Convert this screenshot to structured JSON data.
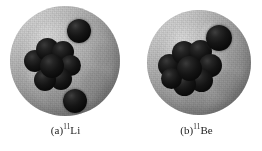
{
  "figure": {
    "kind": "scientific-illustration",
    "background_color": "#ffffff",
    "halo_color": "#9d9d9d",
    "nucleon_color": "#101010"
  },
  "panels": [
    {
      "id": "panel-a",
      "label_prefix": "(a)",
      "mass_number": "11",
      "element_symbol": "Li",
      "caption_full": "(a)11Li",
      "halo": {
        "name": "halo-sphere",
        "center_x": 65,
        "center_y": 61,
        "radius": 55
      },
      "core": {
        "name": "core-cluster",
        "center_x": 52,
        "center_y": 64,
        "nucleon_count": 7
      },
      "halo_neutrons": [
        {
          "name": "halo-neutron-upper-right",
          "center_x": 79,
          "center_y": 31,
          "radius": 12
        },
        {
          "name": "halo-neutron-lower-right",
          "center_x": 75,
          "center_y": 101,
          "radius": 12
        }
      ]
    },
    {
      "id": "panel-b",
      "label_prefix": "(b)",
      "mass_number": "11",
      "element_symbol": "Be",
      "caption_full": "(b)11Be",
      "halo": {
        "name": "halo-sphere",
        "center_x": 68,
        "center_y": 63,
        "radius": 52
      },
      "core": {
        "name": "core-cluster",
        "center_x": 58,
        "center_y": 68,
        "nucleon_count": 8
      },
      "halo_neutrons": [
        {
          "name": "halo-neutron-upper-right",
          "center_x": 88,
          "center_y": 38,
          "radius": 13
        }
      ]
    }
  ]
}
